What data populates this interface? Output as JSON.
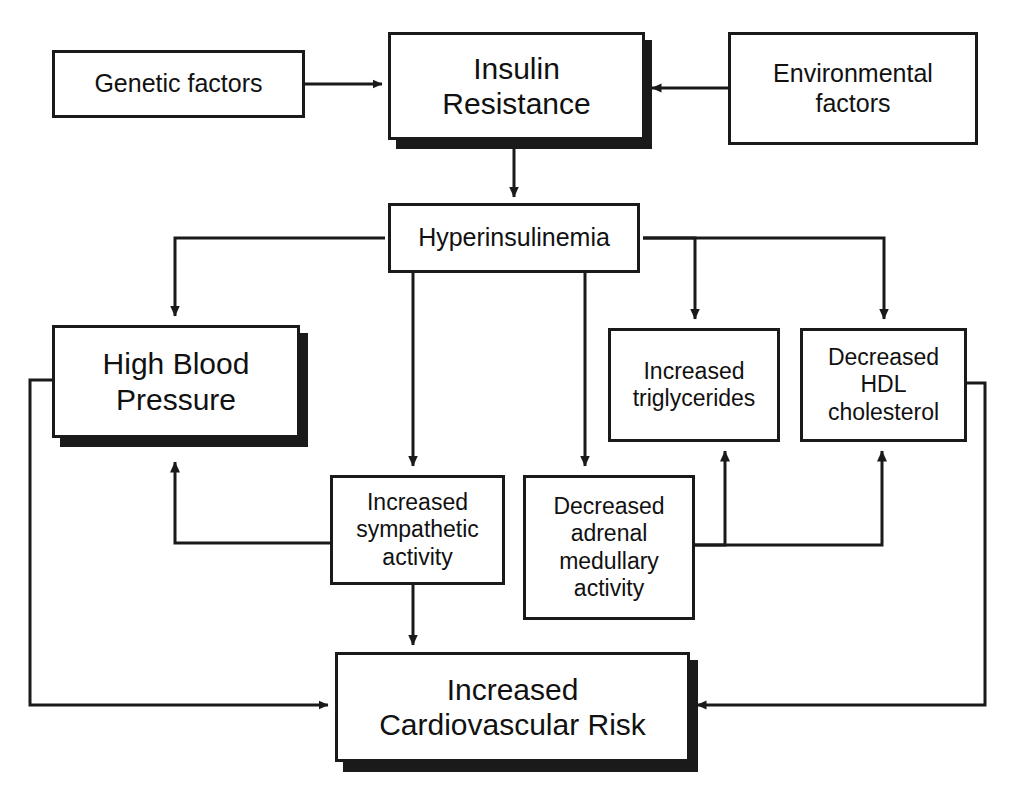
{
  "diagram": {
    "background_color": "#ffffff",
    "line_color": "#1a1a1a",
    "text_color": "#111111",
    "nodes": [
      {
        "id": "genetic-factors",
        "label": "Genetic factors",
        "x": 52,
        "y": 50,
        "w": 253,
        "h": 68,
        "size": "t-medium",
        "shadow": false
      },
      {
        "id": "insulin-resistance",
        "label": "Insulin\nResistance",
        "x": 388,
        "y": 32,
        "w": 257,
        "h": 108,
        "size": "t-large",
        "shadow": true
      },
      {
        "id": "environmental-factors",
        "label": "Environmental\nfactors",
        "x": 728,
        "y": 32,
        "w": 250,
        "h": 113,
        "size": "t-medium",
        "shadow": false
      },
      {
        "id": "hyperinsulinemia",
        "label": "Hyperinsulinemia",
        "x": 388,
        "y": 203,
        "w": 252,
        "h": 70,
        "size": "t-medium",
        "shadow": false
      },
      {
        "id": "high-blood-pressure",
        "label": "High Blood\nPressure",
        "x": 52,
        "y": 325,
        "w": 248,
        "h": 113,
        "size": "t-large",
        "shadow": true
      },
      {
        "id": "increased-triglycerides",
        "label": "Increased\ntriglycerides",
        "x": 608,
        "y": 328,
        "w": 172,
        "h": 114,
        "size": "t-small",
        "shadow": false
      },
      {
        "id": "decreased-hdl-cholesterol",
        "label": "Decreased\nHDL\ncholesterol",
        "x": 800,
        "y": 328,
        "w": 167,
        "h": 114,
        "size": "t-small",
        "shadow": false
      },
      {
        "id": "increased-sympathetic-activity",
        "label": "Increased\nsympathetic\nactivity",
        "x": 330,
        "y": 475,
        "w": 175,
        "h": 110,
        "size": "t-small",
        "shadow": false
      },
      {
        "id": "decreased-adrenal-medullary-activity",
        "label": "Decreased\nadrenal\nmedullary\nactivity",
        "x": 523,
        "y": 475,
        "w": 172,
        "h": 145,
        "size": "t-small",
        "shadow": false
      },
      {
        "id": "increased-cardiovascular-risk",
        "label": "Increased\nCardiovascular Risk",
        "x": 335,
        "y": 652,
        "w": 355,
        "h": 110,
        "size": "t-large",
        "shadow": true
      }
    ],
    "edges": [
      {
        "id": "genetic-to-insulin",
        "from": "genetic-factors",
        "to": "insulin-resistance",
        "points": "305,84 382,84",
        "arrow": "right",
        "arrow_at": "382,84"
      },
      {
        "id": "environmental-to-insulin",
        "from": "environmental-factors",
        "to": "insulin-resistance",
        "points": "728,88 652,88",
        "arrow": "left",
        "arrow_at": "652,88"
      },
      {
        "id": "insulin-to-hyperinsulinemia",
        "from": "insulin-resistance",
        "to": "hyperinsulinemia",
        "points": "514,148 514,197",
        "arrow": "down",
        "arrow_at": "514,197"
      },
      {
        "id": "hyperinsulinemia-to-high-blood-pressure",
        "from": "hyperinsulinemia",
        "to": "high-blood-pressure",
        "points": "385,238 175,238 175,316",
        "arrow": "down",
        "arrow_at": "175,316"
      },
      {
        "id": "hyperinsulinemia-to-sympathetic",
        "from": "hyperinsulinemia",
        "to": "increased-sympathetic-activity",
        "points": "413,273 413,466",
        "arrow": "down",
        "arrow_at": "413,466"
      },
      {
        "id": "hyperinsulinemia-to-adrenal",
        "from": "hyperinsulinemia",
        "to": "decreased-adrenal-medullary-activity",
        "points": "585,273 585,466",
        "arrow": "down",
        "arrow_at": "585,466"
      },
      {
        "id": "hyperinsulinemia-to-triglycerides",
        "from": "hyperinsulinemia",
        "to": "increased-triglycerides",
        "points": "643,238 695,238 695,319",
        "arrow": "down",
        "arrow_at": "695,319"
      },
      {
        "id": "hyperinsulinemia-to-hdl",
        "from": "hyperinsulinemia",
        "to": "decreased-hdl-cholesterol",
        "points": "643,238 884,238 884,319",
        "arrow": "down",
        "arrow_at": "884,319"
      },
      {
        "id": "sympathetic-to-high-blood-pressure",
        "from": "increased-sympathetic-activity",
        "to": "high-blood-pressure",
        "points": "330,543 175,543 175,462",
        "arrow": "up",
        "arrow_at": "175,462"
      },
      {
        "id": "sympathetic-to-cardiovascular-risk",
        "from": "increased-sympathetic-activity",
        "to": "increased-cardiovascular-risk",
        "points": "413,585 413,645",
        "arrow": "down",
        "arrow_at": "413,645"
      },
      {
        "id": "adrenal-to-triglycerides",
        "from": "decreased-adrenal-medullary-activity",
        "to": "increased-triglycerides",
        "points": "695,545 725,545 725,451",
        "arrow": "up",
        "arrow_at": "725,451"
      },
      {
        "id": "adrenal-to-hdl",
        "from": "decreased-adrenal-medullary-activity",
        "to": "decreased-hdl-cholesterol",
        "points": "695,545 882,545 882,451",
        "arrow": "up",
        "arrow_at": "882,451"
      },
      {
        "id": "high-blood-pressure-to-cardiovascular-risk",
        "from": "high-blood-pressure",
        "to": "increased-cardiovascular-risk",
        "points": "52,380 30,380 30,705 328,705",
        "arrow": "right",
        "arrow_at": "328,705"
      },
      {
        "id": "hdl-to-cardiovascular-risk",
        "from": "decreased-hdl-cholesterol",
        "to": "increased-cardiovascular-risk",
        "points": "967,383 985,383 985,705 697,705",
        "arrow": "left",
        "arrow_at": "697,705"
      }
    ]
  }
}
